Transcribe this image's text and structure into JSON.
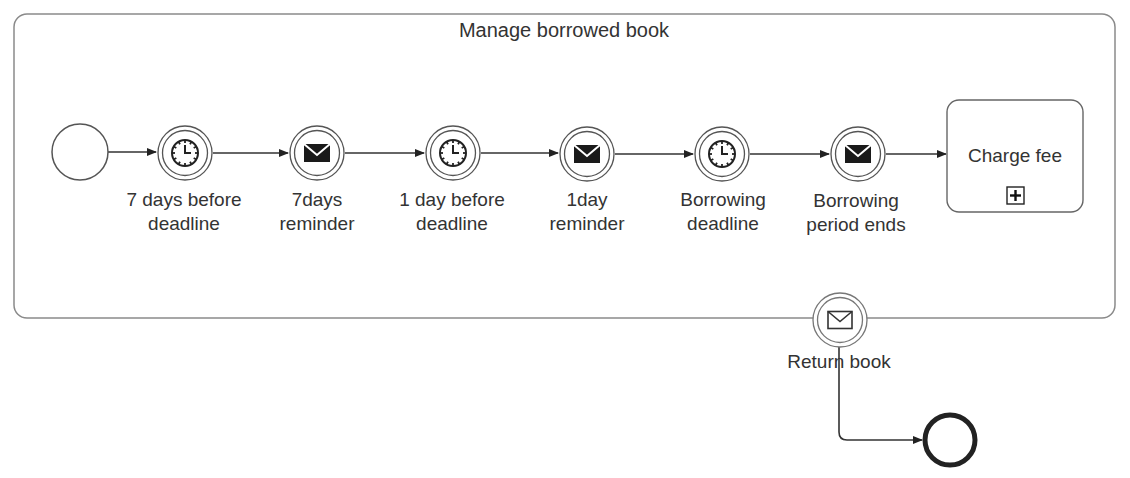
{
  "subprocess": {
    "title": "Manage borrowed book"
  },
  "events": [
    {
      "id": "start",
      "type": "start-event",
      "label_line1": "",
      "label_line2": ""
    },
    {
      "id": "timer-7days",
      "type": "intermediate-timer",
      "label_line1": "7 days before",
      "label_line2": "deadline"
    },
    {
      "id": "msg-7days",
      "type": "intermediate-message-throw",
      "label_line1": "7days",
      "label_line2": "reminder"
    },
    {
      "id": "timer-1day",
      "type": "intermediate-timer",
      "label_line1": "1 day before",
      "label_line2": "deadline"
    },
    {
      "id": "msg-1day",
      "type": "intermediate-message-throw",
      "label_line1": "1day",
      "label_line2": "reminder"
    },
    {
      "id": "timer-deadline",
      "type": "intermediate-timer",
      "label_line1": "Borrowing",
      "label_line2": "deadline"
    },
    {
      "id": "msg-period-ends",
      "type": "intermediate-message-throw",
      "label_line1": "Borrowing",
      "label_line2": "period ends"
    }
  ],
  "task": {
    "label": "Charge fee",
    "marker": "collapsed-subprocess-plus"
  },
  "boundary_event": {
    "type": "boundary-message-catch",
    "label": "Return book"
  },
  "end_event": {
    "type": "end-event"
  },
  "colors": {
    "stroke": "#333333",
    "container_stroke": "#888888",
    "text": "#333333"
  }
}
